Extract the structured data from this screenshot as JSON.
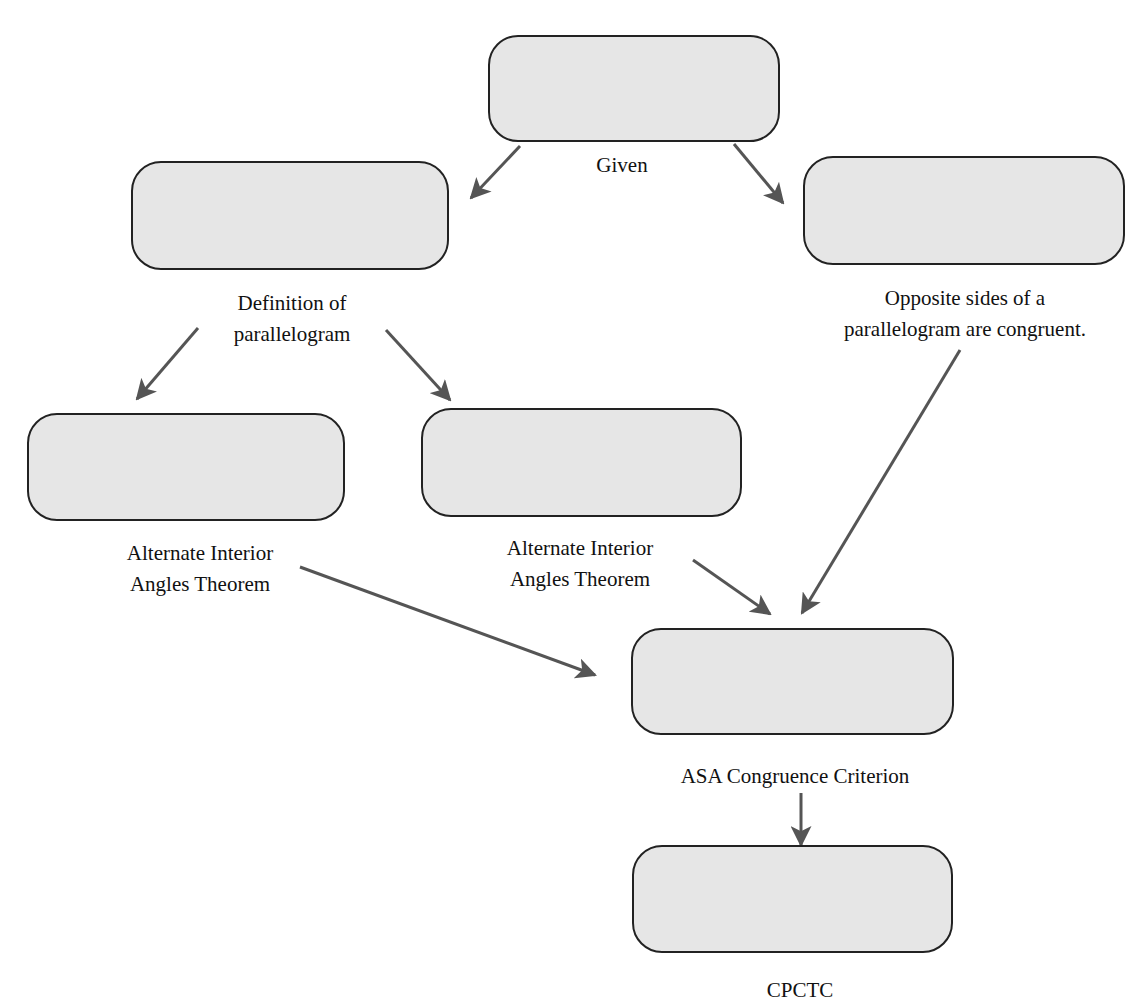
{
  "diagram": {
    "type": "flow-proof",
    "box_fill": "#e6e6e6",
    "box_stroke": "#222222",
    "arrow_color": "#555555",
    "nodes": [
      {
        "id": "given",
        "label": "Given",
        "statement": "",
        "x": 488,
        "y": 35,
        "w": 292,
        "h": 107,
        "label_x": 622,
        "label_y": 150
      },
      {
        "id": "def-parallelogram",
        "label": "Definition of\nparallelogram",
        "line1": "Definition of",
        "line2": "parallelogram",
        "statement": "",
        "x": 131,
        "y": 161,
        "w": 318,
        "h": 109,
        "label_x": 292,
        "label_y": 288
      },
      {
        "id": "opposite-sides",
        "label": "Opposite sides of a parallelogram are congruent.",
        "line1": "Opposite sides of a",
        "line2": "parallelogram are congruent.",
        "statement": "",
        "x": 803,
        "y": 156,
        "w": 322,
        "h": 109,
        "label_x": 965,
        "label_y": 283
      },
      {
        "id": "aia-left",
        "label": "Alternate Interior Angles Theorem",
        "line1": "Alternate Interior",
        "line2": "Angles Theorem",
        "statement": "",
        "x": 27,
        "y": 413,
        "w": 318,
        "h": 108,
        "label_x": 200,
        "label_y": 538
      },
      {
        "id": "aia-mid",
        "label": "Alternate Interior Angles Theorem",
        "line1": "Alternate Interior",
        "line2": "Angles Theorem",
        "statement": "",
        "x": 421,
        "y": 408,
        "w": 321,
        "h": 109,
        "label_x": 580,
        "label_y": 533
      },
      {
        "id": "asa",
        "label": "ASA Congruence Criterion",
        "statement": "",
        "x": 631,
        "y": 628,
        "w": 323,
        "h": 107,
        "label_x": 795,
        "label_y": 761
      },
      {
        "id": "cpctc",
        "label": "CPCTC",
        "statement": "",
        "x": 632,
        "y": 845,
        "w": 321,
        "h": 108,
        "label_x": 800,
        "label_y": 975
      }
    ],
    "edges": [
      {
        "from": "given",
        "to": "def-parallelogram",
        "x1": 520,
        "y1": 146,
        "x2": 471,
        "y2": 198
      },
      {
        "from": "given",
        "to": "opposite-sides",
        "x1": 734,
        "y1": 144,
        "x2": 783,
        "y2": 203
      },
      {
        "from": "def-parallelogram",
        "to": "aia-left",
        "x1": 198,
        "y1": 328,
        "x2": 137,
        "y2": 399
      },
      {
        "from": "def-parallelogram",
        "to": "aia-mid",
        "x1": 386,
        "y1": 330,
        "x2": 450,
        "y2": 400
      },
      {
        "from": "aia-left",
        "to": "asa",
        "x1": 300,
        "y1": 567,
        "x2": 595,
        "y2": 675
      },
      {
        "from": "aia-mid",
        "to": "asa",
        "x1": 693,
        "y1": 560,
        "x2": 770,
        "y2": 614
      },
      {
        "from": "opposite-sides",
        "to": "asa",
        "x1": 960,
        "y1": 350,
        "x2": 802,
        "y2": 613
      },
      {
        "from": "asa",
        "to": "cpctc",
        "x1": 801,
        "y1": 793,
        "x2": 801,
        "y2": 845
      }
    ]
  }
}
